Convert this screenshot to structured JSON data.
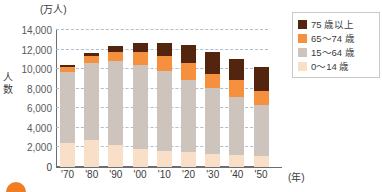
{
  "chart_data": {
    "type": "bar",
    "subtype": "stacked",
    "title": "",
    "unit_label": "(万人)",
    "ylabel": "人数",
    "xlabel": "(年)",
    "xunit": "(年)",
    "categories": [
      "'70",
      "'80",
      "'90",
      "'00",
      "'10",
      "'20",
      "'30",
      "'40",
      "'50"
    ],
    "ylim": [
      0,
      14000
    ],
    "ytick_values": [
      0,
      2000,
      4000,
      6000,
      8000,
      10000,
      12000,
      14000
    ],
    "ytick_labels": [
      "0",
      "2,000",
      "4,000",
      "6,000",
      "8,000",
      "10,000",
      "12,000",
      "14,000"
    ],
    "grid": true,
    "legend_position": "top-right",
    "series": [
      {
        "name": "0～14 歳",
        "color": "#fadfc8",
        "values": [
          2480,
          2750,
          2250,
          1850,
          1680,
          1500,
          1320,
          1190,
          1080
        ]
      },
      {
        "name": "15～64 歳",
        "color": "#cdc5bd",
        "values": [
          7210,
          7880,
          8590,
          8620,
          8100,
          7400,
          6780,
          5980,
          5270
        ]
      },
      {
        "name": "65～74 歳",
        "color": "#f5913e",
        "values": [
          520,
          700,
          890,
          1300,
          1520,
          1750,
          1420,
          1680,
          1420
        ]
      },
      {
        "name": "75 歳以上",
        "color": "#53250f",
        "values": [
          220,
          370,
          600,
          900,
          1420,
          1870,
          2280,
          2240,
          2420
        ]
      }
    ],
    "totals": [
      10430,
      11700,
      12330,
      12670,
      12720,
      12520,
      11800,
      11090,
      10190
    ]
  },
  "legend": {
    "items": [
      {
        "label": "75 歳以上",
        "swatch": "s3"
      },
      {
        "label": "65～74 歳",
        "swatch": "s2"
      },
      {
        "label": "15～64 歳",
        "swatch": "s1"
      },
      {
        "label": "0～14 歳",
        "swatch": "s0"
      }
    ]
  },
  "colors": {
    "age_75_plus": "#53250f",
    "age_65_74": "#f5913e",
    "age_15_64": "#cdc5bd",
    "age_0_14": "#fadfc8",
    "grid": "#9fb4c8",
    "axis": "#6d6d6d",
    "accent_dot": "#f07d22"
  }
}
